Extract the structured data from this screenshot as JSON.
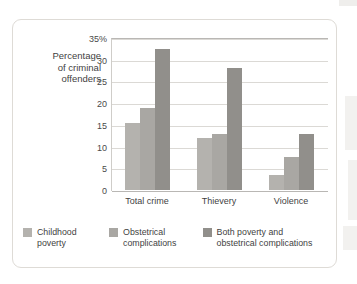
{
  "chart_data": {
    "type": "bar",
    "title": "",
    "subtitle": "",
    "xlabel": "",
    "ylabel": "Percentage of criminal offenders",
    "ylabel_lines": [
      "Percentage",
      "of criminal",
      "offenders"
    ],
    "categories": [
      "Total crime",
      "Thievery",
      "Violence"
    ],
    "series": [
      {
        "name": "Childhood poverty",
        "values": [
          15.5,
          12,
          3.5
        ],
        "color": "#b4b2ae"
      },
      {
        "name": "Obstetrical complications",
        "values": [
          19,
          13,
          7.5
        ],
        "color": "#a9a7a3"
      },
      {
        "name": "Both poverty and obstetrical complications",
        "values": [
          32.5,
          28,
          13
        ],
        "color": "#918f8b"
      }
    ],
    "ylim": [
      0,
      35
    ],
    "yticks": [
      0,
      5,
      10,
      15,
      20,
      25,
      30,
      35
    ],
    "ytick_labels": [
      "0",
      "5",
      "10",
      "15",
      "20",
      "25",
      "30",
      "35%"
    ],
    "grid": true,
    "legend_position": "bottom"
  },
  "legend": {
    "items": [
      {
        "label_lines": [
          "Childhood",
          "poverty"
        ]
      },
      {
        "label_lines": [
          "Obstetrical",
          "complications"
        ]
      },
      {
        "label_lines": [
          "Both poverty and",
          "obstetrical complications"
        ]
      }
    ]
  },
  "colors": {
    "series_1": "#b4b2ae",
    "series_2": "#a9a7a3",
    "series_3": "#918f8b",
    "gridline": "#dbd9d5",
    "axis": "#b9b7b4",
    "panel_border": "#dedbd6",
    "text": "#3f3f3f",
    "background": "#ffffff"
  }
}
